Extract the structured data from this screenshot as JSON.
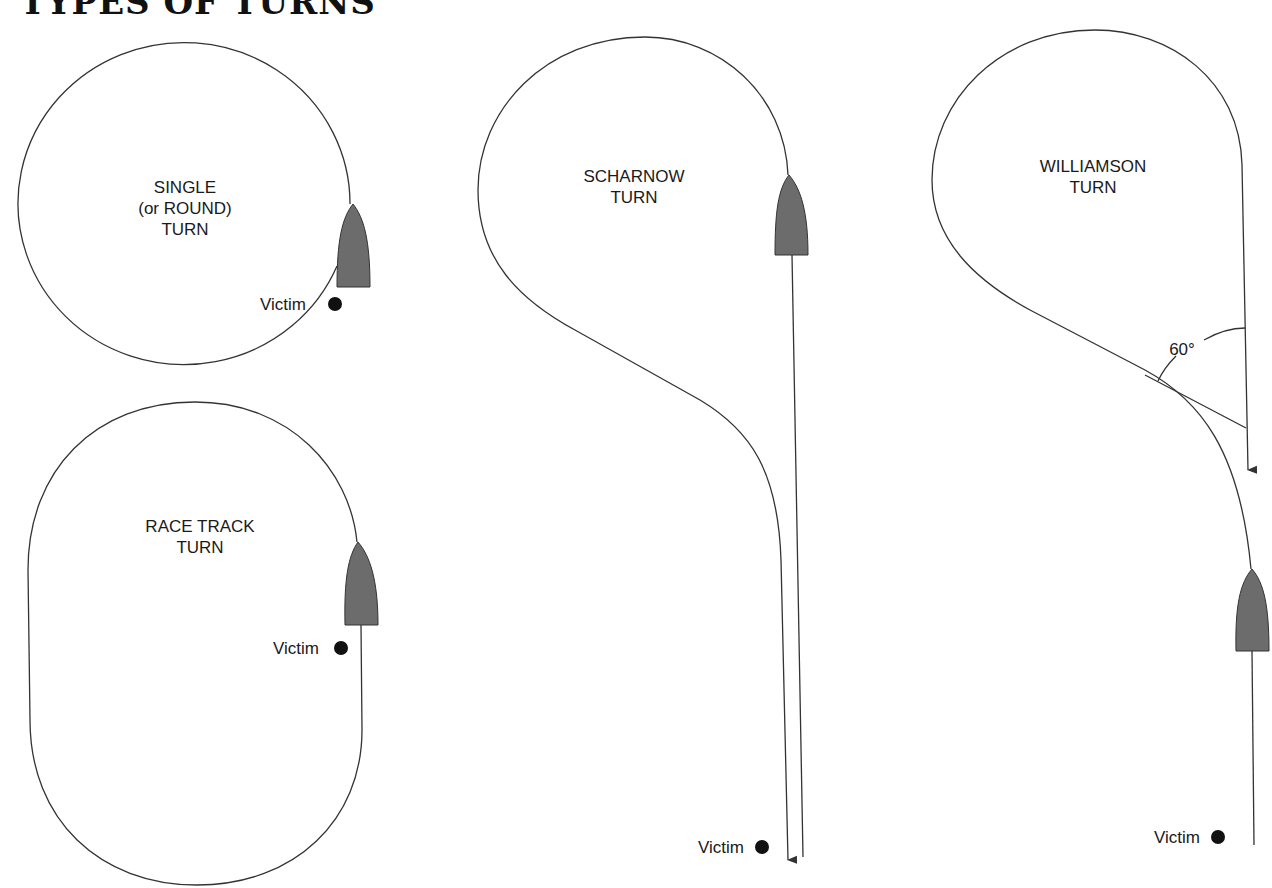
{
  "title": "TYPES OF TURNS",
  "diagrams": {
    "single": {
      "label_lines": [
        "SINGLE",
        "(or ROUND)",
        "TURN"
      ],
      "victim_label": "Victim"
    },
    "racetrack": {
      "label_lines": [
        "RACE TRACK",
        "TURN"
      ],
      "victim_label": "Victim"
    },
    "scharnow": {
      "label_lines": [
        "SCHARNOW",
        "TURN"
      ],
      "victim_label": "Victim"
    },
    "williamson": {
      "label_lines": [
        "WILLIAMSON",
        "TURN"
      ],
      "victim_label": "Victim",
      "angle_label": "60°"
    }
  },
  "colors": {
    "boat_fill": "#6c6c6c",
    "line": "#333333",
    "victim_dot": "#111111"
  }
}
